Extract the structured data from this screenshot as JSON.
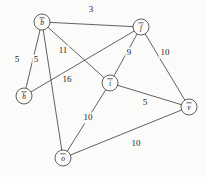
{
  "figure": {
    "type": "undirected-weighted-graph",
    "background_color": "#fbfbfa",
    "stroke_color": "#3a3a38",
    "text_color": "#1b1b1a"
  },
  "chart_data": {
    "type": "diagram",
    "title": "",
    "xlabel": "",
    "ylabel": "",
    "graph_type": "undirected weighted graph",
    "nodes": [
      {
        "id": "b",
        "label": "b",
        "overline": true,
        "x": 42,
        "y": 22,
        "r": 8
      },
      {
        "id": "f",
        "label": "f",
        "overline": true,
        "x": 141,
        "y": 27,
        "r": 8
      },
      {
        "id": "h",
        "label": "h",
        "overline": true,
        "x": 24,
        "y": 96,
        "r": 8
      },
      {
        "id": "i",
        "label": "i",
        "overline": true,
        "x": 110,
        "y": 83,
        "r": 8
      },
      {
        "id": "o",
        "label": "o",
        "overline": true,
        "x": 63,
        "y": 158,
        "r": 8
      },
      {
        "id": "v",
        "label": "v",
        "overline": true,
        "x": 189,
        "y": 107,
        "r": 8
      }
    ],
    "edges": [
      {
        "source": "b",
        "target": "f",
        "weight": 3,
        "label_x": 91,
        "label_y": 10
      },
      {
        "source": "b",
        "target": "h",
        "weight": 5,
        "label_x": 17,
        "label_y": 60
      },
      {
        "source": "b",
        "target": "o",
        "weight": 5,
        "label_x": 36,
        "label_y": 60
      },
      {
        "source": "b",
        "target": "i",
        "weight": 11,
        "label_x": 63,
        "label_y": 51
      },
      {
        "source": "h",
        "target": "f",
        "weight": 16,
        "label_x": 67,
        "label_y": 80
      },
      {
        "source": "f",
        "target": "i",
        "weight": 9,
        "label_x": 129,
        "label_y": 53
      },
      {
        "source": "f",
        "target": "v",
        "weight": 10,
        "label_x": 165,
        "label_y": 53
      },
      {
        "source": "i",
        "target": "v",
        "weight": 5,
        "label_x": 145,
        "label_y": 103
      },
      {
        "source": "i",
        "target": "o",
        "weight": 10,
        "label_x": 88,
        "label_y": 118
      },
      {
        "source": "o",
        "target": "v",
        "weight": 10,
        "label_x": 136,
        "label_y": 144
      }
    ],
    "node_count": 6,
    "edge_count": 10,
    "weights": [
      3,
      5,
      5,
      11,
      16,
      9,
      10,
      5,
      10,
      10
    ]
  }
}
